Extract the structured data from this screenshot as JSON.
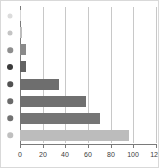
{
  "chart_data": {
    "type": "bar",
    "orientation": "horizontal",
    "title": "",
    "subtitle": "",
    "xlabel": "",
    "ylabel": "",
    "xlim": [
      0,
      120
    ],
    "xticks": [
      0,
      20,
      40,
      60,
      80,
      100,
      120
    ],
    "xtick_labels": [
      "0",
      "20",
      "40",
      "60",
      "80",
      "100",
      "120"
    ],
    "grid": true,
    "grid_axis": "x",
    "legend": false,
    "categories": [
      "1",
      "2",
      "3",
      "4",
      "5",
      "6",
      "7",
      "8"
    ],
    "values": [
      1,
      2,
      5,
      5,
      34,
      58,
      71,
      96
    ],
    "bar_colors": [
      "#d6d6d6",
      "#bdbdbd",
      "#8a8a8a",
      "#636363",
      "#6e6e6e",
      "#707070",
      "#757575",
      "#bcbcbc"
    ],
    "marker_colors": [
      "#dcdcdc",
      "#c4c4c4",
      "#8e8e8e",
      "#3a3a3a",
      "#525252",
      "#6a6a6a",
      "#727272",
      "#c0c0c0"
    ],
    "marker_sizes": [
      5,
      5,
      5.5,
      6,
      5.5,
      5.5,
      5.5,
      5.5
    ],
    "axis_color": "#7a7a7a",
    "grid_color": "#c8c8c8",
    "tick_label_color": "#3c3c3c",
    "background_color": "#ffffff",
    "border_color": "#d9d9d9"
  }
}
